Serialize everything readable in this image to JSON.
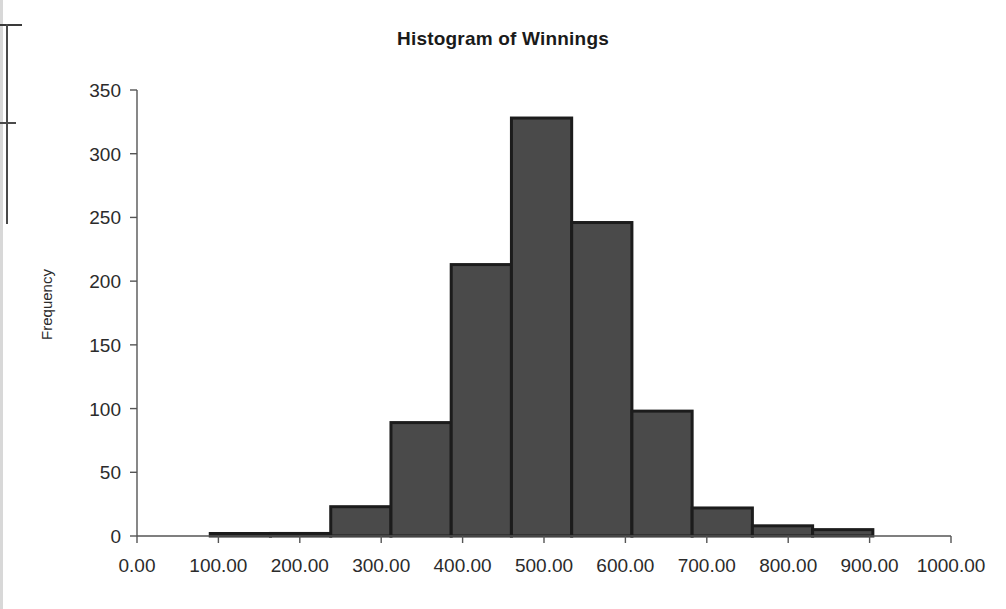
{
  "chart_data": {
    "type": "bar",
    "title": "Histogram of Winnings",
    "xlabel": "",
    "ylabel": "Frequency",
    "grid": false,
    "legend": null,
    "xlim": [
      0,
      1000
    ],
    "ylim": [
      0,
      350
    ],
    "x_tick_labels": [
      "0.00",
      "100.00",
      "200.00",
      "300.00",
      "400.00",
      "500.00",
      "600.00",
      "700.00",
      "800.00",
      "900.00",
      "1000.00"
    ],
    "x_tick_values": [
      0,
      100,
      200,
      300,
      400,
      500,
      600,
      700,
      800,
      900,
      1000
    ],
    "y_tick_labels": [
      "0",
      "50",
      "100",
      "150",
      "200",
      "250",
      "300",
      "350"
    ],
    "y_tick_values": [
      0,
      50,
      100,
      150,
      200,
      250,
      300,
      350
    ],
    "bin_width": 74,
    "bins": [
      {
        "start": 90,
        "end": 164,
        "value": 1
      },
      {
        "start": 164,
        "end": 238,
        "value": 2
      },
      {
        "start": 238,
        "end": 312,
        "value": 23
      },
      {
        "start": 312,
        "end": 386,
        "value": 89
      },
      {
        "start": 386,
        "end": 460,
        "value": 213
      },
      {
        "start": 460,
        "end": 534,
        "value": 328
      },
      {
        "start": 534,
        "end": 608,
        "value": 246
      },
      {
        "start": 608,
        "end": 682,
        "value": 98
      },
      {
        "start": 682,
        "end": 756,
        "value": 22
      },
      {
        "start": 756,
        "end": 830,
        "value": 8
      },
      {
        "start": 830,
        "end": 904,
        "value": 5
      }
    ],
    "categories": [
      "90-164",
      "164-238",
      "238-312",
      "312-386",
      "386-460",
      "460-534",
      "534-608",
      "608-682",
      "682-756",
      "756-830",
      "830-904"
    ],
    "values": [
      1,
      2,
      23,
      89,
      213,
      328,
      246,
      98,
      22,
      8,
      5
    ],
    "colors": {
      "bar_fill": "#4a4a4a",
      "bar_stroke": "#1c1c1c",
      "axis": "#555555",
      "text": "#2b2b2b",
      "title": "#1a1a1a",
      "background": "#ffffff"
    }
  }
}
